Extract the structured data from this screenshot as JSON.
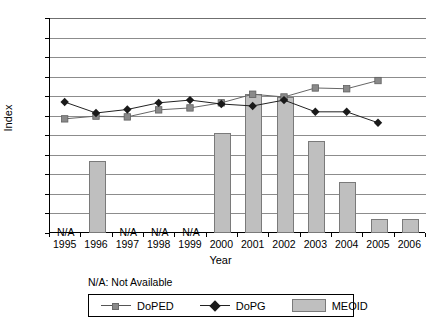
{
  "chart_data": {
    "type": "bar",
    "title": "",
    "xlabel": "Year",
    "ylabel": "Index",
    "categories": [
      "1995",
      "1996",
      "1997",
      "1998",
      "1999",
      "2000",
      "2001",
      "2002",
      "2003",
      "2004",
      "2005",
      "2006"
    ],
    "ylim": [
      45,
      100
    ],
    "ytick_step": 5,
    "yticks": [
      45,
      50,
      55,
      60,
      65,
      70,
      75,
      80,
      85,
      90,
      95,
      100
    ],
    "grid": true,
    "legend_position": "bottom",
    "series": [
      {
        "name": "DoPED",
        "type": "line",
        "marker": "square",
        "color": "#8a8a8a",
        "values": [
          74.2,
          74.9,
          74.7,
          76.5,
          77.0,
          78.3,
          80.5,
          79.8,
          82.1,
          81.9,
          84.0,
          null
        ]
      },
      {
        "name": "DoPG",
        "type": "line",
        "marker": "diamond",
        "color": "#1a1a1a",
        "values": [
          78.5,
          75.7,
          76.6,
          78.3,
          79.0,
          78.0,
          77.5,
          79.0,
          76.0,
          76.0,
          73.2,
          null
        ]
      },
      {
        "name": "MEOID",
        "type": "bar",
        "color": "#bfbfbf",
        "values": [
          null,
          63.5,
          null,
          null,
          null,
          70.5,
          80.5,
          79.8,
          68.5,
          58.0,
          48.5,
          48.5
        ]
      }
    ],
    "annotations": [
      {
        "label": "N/A",
        "category": "1995"
      },
      {
        "label": "N/A",
        "category": "1997"
      },
      {
        "label": "N/A",
        "category": "1998"
      },
      {
        "label": "N/A",
        "category": "1999"
      }
    ],
    "footnote": "N/A: Not Available"
  },
  "legend": {
    "items": [
      {
        "label": "DoPED",
        "key": "line-square-marker"
      },
      {
        "label": "DoPG",
        "key": "line-diamond-marker"
      },
      {
        "label": "MEOID",
        "key": "bar-swatch"
      }
    ]
  }
}
